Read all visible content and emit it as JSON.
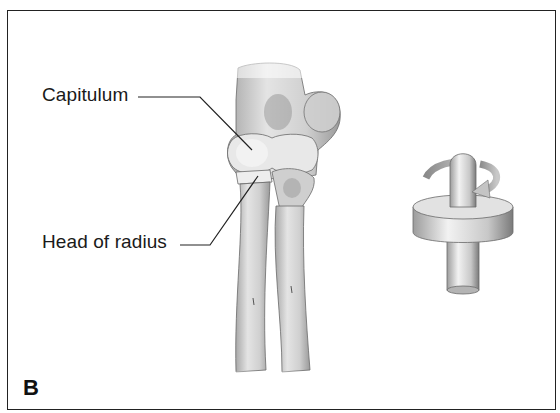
{
  "figure": {
    "panel_letter": "B",
    "labels": [
      {
        "id": "capitulum",
        "text": "Capitulum"
      },
      {
        "id": "head-of-radius",
        "text": "Head of radius"
      }
    ],
    "illustrations": [
      {
        "id": "elbow-bones",
        "description": "Anterior view of distal humerus with capitulum articulating with head of radius and ulna; radius and ulna shafts below"
      },
      {
        "id": "pivot-joint-model",
        "description": "Pivot joint model: cylinder rotating within a ring, curved arrows indicating rotation"
      }
    ],
    "colors": {
      "border": "#222222",
      "text": "#1a1a1a",
      "bone_light": "#e6e6e6",
      "bone_shadow": "#9a9a9a"
    }
  }
}
